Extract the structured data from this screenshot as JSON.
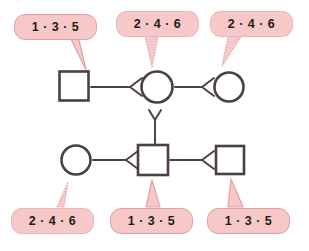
{
  "diagram": {
    "colors": {
      "bubble_fill": "#f6c8c8",
      "bubble_border_solid": "#e3a0a0",
      "bubble_border_dotted": "#e0a5a5",
      "shape_stroke": "#4a403d",
      "connector_stroke": "#4a403d",
      "text": "#241a16",
      "background": "#ffffff"
    },
    "callouts": [
      {
        "id": "callout-top-left",
        "label": "1 · 3 · 5",
        "border_style": "solid",
        "points_to": "square-top-left",
        "x": 14,
        "y": 14,
        "w": 83,
        "h": 26,
        "tail": "M 71 39 L 86 70 L 79 40 Z"
      },
      {
        "id": "callout-top-middle",
        "label": "2 · 4 · 6",
        "border_style": "dotted",
        "points_to": "circle-top-middle",
        "x": 116,
        "y": 11,
        "w": 83,
        "h": 26,
        "tail": "M 145 36 L 152 68 L 158 37 Z"
      },
      {
        "id": "callout-top-right",
        "label": "2 · 4 · 6",
        "border_style": "dotted",
        "points_to": "circle-top-right",
        "x": 210,
        "y": 11,
        "w": 83,
        "h": 26,
        "tail": "M 228 36 L 222 66 L 241 37 Z"
      },
      {
        "id": "callout-bottom-left",
        "label": "2 · 4 · 6",
        "border_style": "dotted",
        "points_to": "circle-bottom-left",
        "x": 11,
        "y": 208,
        "w": 83,
        "h": 26,
        "tail": "M 57 207 L 68 182 L 64 207 Z"
      },
      {
        "id": "callout-bottom-middle",
        "label": "1 · 3 · 5",
        "border_style": "solid",
        "points_to": "square-bottom-middle",
        "x": 110,
        "y": 208,
        "w": 83,
        "h": 26,
        "tail": "M 146 207 L 152 180 L 160 207 Z"
      },
      {
        "id": "callout-bottom-right",
        "label": "1 · 3 · 5",
        "border_style": "solid",
        "points_to": "square-bottom-right",
        "x": 207,
        "y": 208,
        "w": 83,
        "h": 26,
        "tail": "M 228 207 L 231 179 L 243 207 Z"
      }
    ],
    "nodes": [
      {
        "id": "square-top-left",
        "shape": "square",
        "cx": 74,
        "cy": 86,
        "size": 29
      },
      {
        "id": "circle-top-middle",
        "shape": "circle",
        "cx": 157,
        "cy": 87,
        "size": 31
      },
      {
        "id": "circle-top-right",
        "shape": "circle",
        "cx": 229,
        "cy": 87,
        "size": 29
      },
      {
        "id": "circle-bottom-left",
        "shape": "circle",
        "cx": 76,
        "cy": 160,
        "size": 29
      },
      {
        "id": "square-bottom-middle",
        "shape": "square",
        "cx": 153,
        "cy": 160,
        "size": 30
      },
      {
        "id": "square-bottom-right",
        "shape": "square",
        "cx": 230,
        "cy": 160,
        "size": 28
      }
    ],
    "connectors": [
      {
        "id": "connector-top-left-to-middle",
        "kind": "fork-left",
        "from": "square-top-left",
        "to": "circle-top-middle",
        "path": "M 91 87 L 130 87 M 142 78 L 130 87 L 142 96"
      },
      {
        "id": "connector-top-middle-to-right",
        "kind": "fork-left",
        "from": "circle-top-middle",
        "to": "circle-top-right",
        "path": "M 175 87 L 202 87 M 214 78 L 202 87 L 214 96"
      },
      {
        "id": "connector-vertical-fork",
        "kind": "fork-up",
        "from": "circle-top-middle",
        "to": "square-bottom-middle",
        "path": "M 149 110 L 155 120 L 161 110 M 155 120 L 155 145"
      },
      {
        "id": "connector-bottom-left-to-middle",
        "kind": "fork-left",
        "from": "circle-bottom-left",
        "to": "square-bottom-middle",
        "path": "M 93 160 L 126 160 M 138 151 L 126 160 L 138 169"
      },
      {
        "id": "connector-bottom-middle-to-right",
        "kind": "fork-left",
        "from": "square-bottom-middle",
        "to": "square-bottom-right",
        "path": "M 170 160 L 202 160 M 214 151 L 202 160 L 214 169"
      }
    ]
  }
}
